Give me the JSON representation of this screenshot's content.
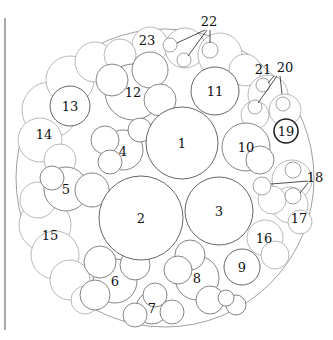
{
  "diagram": {
    "type": "planting-plan",
    "labels": {
      "p1": "1",
      "p2": "2",
      "p3": "3",
      "p4": "4",
      "p5": "5",
      "p6": "6",
      "p7": "7",
      "p8": "8",
      "p9": "9",
      "p10": "10",
      "p11": "11",
      "p12": "12",
      "p13": "13",
      "p14": "14",
      "p15": "15",
      "p16": "16",
      "p17": "17",
      "p18": "18",
      "p19": "19",
      "p20": "20",
      "p21": "21",
      "p22": "22",
      "p23": "23"
    }
  }
}
